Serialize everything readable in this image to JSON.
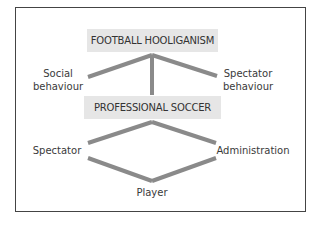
{
  "diagram": {
    "top_box": {
      "label": "FOOTBALL HOOLIGANISM"
    },
    "middle_box": {
      "label": "PROFESSIONAL SOCCER"
    },
    "upper_labels": {
      "left": {
        "line1": "Social",
        "line2": "behaviour"
      },
      "right": {
        "line1": "Spectator",
        "line2": "behaviour"
      }
    },
    "lower_labels": {
      "left": "Spectator",
      "right": "Administration",
      "bottom": "Player"
    },
    "colors": {
      "box_fill": "#e6e6e6",
      "connector": "#8a8a8a",
      "frame": "#444444",
      "text": "#333333"
    }
  }
}
